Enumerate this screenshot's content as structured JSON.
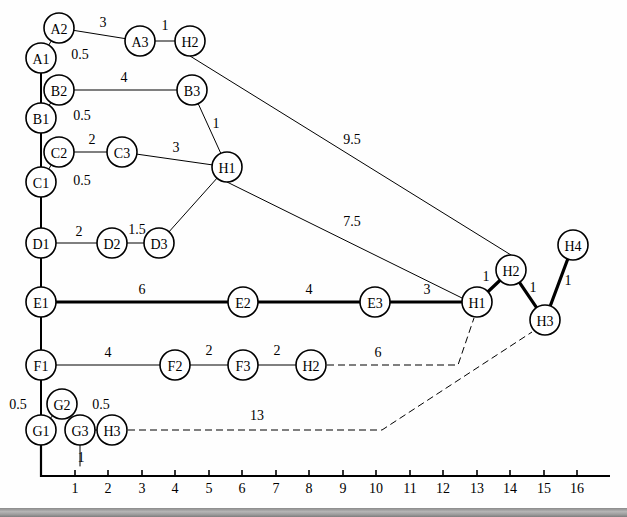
{
  "figure": {
    "node_radius": 15,
    "colors": {
      "stroke": "#000000",
      "fill": "#ffffff",
      "background": "#fefefe",
      "bar": "#9a9a9a"
    }
  },
  "axis": {
    "orientation": "horizontal",
    "origin": {
      "x": 41,
      "y": 476
    },
    "ticks": [
      "1",
      "2",
      "3",
      "4",
      "5",
      "6",
      "7",
      "8",
      "9",
      "10",
      "11",
      "12",
      "13",
      "14",
      "15",
      "16"
    ],
    "tick_positions": [
      75,
      108,
      142,
      175,
      209,
      242,
      276,
      309,
      343,
      376,
      410,
      443,
      477,
      510,
      544,
      577
    ],
    "vertical_segment_top": 430
  },
  "nodes": [
    {
      "id": "A2",
      "label": "A2",
      "x": 59,
      "y": 28
    },
    {
      "id": "A3",
      "label": "A3",
      "x": 140,
      "y": 41
    },
    {
      "id": "H2t",
      "label": "H2",
      "x": 190,
      "y": 41
    },
    {
      "id": "A1",
      "label": "A1",
      "x": 41,
      "y": 58
    },
    {
      "id": "B2",
      "label": "B2",
      "x": 59,
      "y": 90
    },
    {
      "id": "B3",
      "label": "B3",
      "x": 192,
      "y": 90
    },
    {
      "id": "B1",
      "label": "B1",
      "x": 41,
      "y": 118
    },
    {
      "id": "C2",
      "label": "C2",
      "x": 59,
      "y": 152
    },
    {
      "id": "C3",
      "label": "C3",
      "x": 122,
      "y": 152
    },
    {
      "id": "H1c",
      "label": "H1",
      "x": 227,
      "y": 167
    },
    {
      "id": "C1",
      "label": "C1",
      "x": 41,
      "y": 182
    },
    {
      "id": "D1",
      "label": "D1",
      "x": 41,
      "y": 243
    },
    {
      "id": "D2",
      "label": "D2",
      "x": 112,
      "y": 243
    },
    {
      "id": "D3",
      "label": "D3",
      "x": 159,
      "y": 243
    },
    {
      "id": "H4",
      "label": "H4",
      "x": 573,
      "y": 245
    },
    {
      "id": "H2r",
      "label": "H2",
      "x": 511,
      "y": 270
    },
    {
      "id": "E1",
      "label": "E1",
      "x": 41,
      "y": 302
    },
    {
      "id": "E2",
      "label": "E2",
      "x": 243,
      "y": 302
    },
    {
      "id": "E3",
      "label": "E3",
      "x": 375,
      "y": 302
    },
    {
      "id": "H1r",
      "label": "H1",
      "x": 477,
      "y": 302
    },
    {
      "id": "H3r",
      "label": "H3",
      "x": 545,
      "y": 320
    },
    {
      "id": "F1",
      "label": "F1",
      "x": 41,
      "y": 365
    },
    {
      "id": "F2",
      "label": "F2",
      "x": 175,
      "y": 365
    },
    {
      "id": "F3",
      "label": "F3",
      "x": 243,
      "y": 365
    },
    {
      "id": "H2f",
      "label": "H2",
      "x": 311,
      "y": 365
    },
    {
      "id": "G2",
      "label": "G2",
      "x": 62,
      "y": 404
    },
    {
      "id": "G1",
      "label": "G1",
      "x": 41,
      "y": 430
    },
    {
      "id": "G3",
      "label": "G3",
      "x": 80,
      "y": 430
    },
    {
      "id": "H3g",
      "label": "H3",
      "x": 112,
      "y": 430
    }
  ],
  "edges": [
    {
      "from": "A2",
      "to": "A3",
      "weight": "3",
      "style": "thin",
      "label_x": 103,
      "label_y": 27
    },
    {
      "from": "A3",
      "to": "H2t",
      "weight": "1",
      "style": "thin",
      "label_x": 165,
      "label_y": 30
    },
    {
      "from": "A2",
      "to": "A1",
      "weight": "0.5",
      "style": "thin",
      "label_x": 80,
      "label_y": 59
    },
    {
      "from": "A1",
      "to": "B1",
      "weight": "",
      "style": "medium",
      "label_x": 0,
      "label_y": 0
    },
    {
      "from": "B2",
      "to": "B3",
      "weight": "4",
      "style": "thin",
      "label_x": 124,
      "label_y": 82
    },
    {
      "from": "B2",
      "to": "B1",
      "weight": "0.5",
      "style": "thin",
      "label_x": 82,
      "label_y": 120
    },
    {
      "from": "B3",
      "to": "H1c",
      "weight": "1",
      "style": "thin",
      "label_x": 216,
      "label_y": 128
    },
    {
      "from": "B1",
      "to": "C1",
      "weight": "",
      "style": "medium",
      "label_x": 0,
      "label_y": 0
    },
    {
      "from": "C2",
      "to": "C3",
      "weight": "2",
      "style": "thin",
      "label_x": 92,
      "label_y": 144
    },
    {
      "from": "C3",
      "to": "H1c",
      "weight": "3",
      "style": "thin",
      "label_x": 176,
      "label_y": 152
    },
    {
      "from": "C2",
      "to": "C1",
      "weight": "0.5",
      "style": "thin",
      "label_x": 82,
      "label_y": 185
    },
    {
      "from": "C1",
      "to": "D1",
      "weight": "",
      "style": "medium",
      "label_x": 0,
      "label_y": 0
    },
    {
      "from": "D1",
      "to": "D2",
      "weight": "2",
      "style": "thin",
      "label_x": 79,
      "label_y": 236
    },
    {
      "from": "D2",
      "to": "D3",
      "weight": "1.5",
      "style": "thin",
      "label_x": 137,
      "label_y": 234
    },
    {
      "from": "D3",
      "to": "H1c",
      "weight": "",
      "style": "thin",
      "label_x": 0,
      "label_y": 0
    },
    {
      "from": "D1",
      "to": "E1",
      "weight": "",
      "style": "medium",
      "label_x": 0,
      "label_y": 0
    },
    {
      "from": "E1",
      "to": "E2",
      "weight": "6",
      "style": "bold",
      "label_x": 142,
      "label_y": 294
    },
    {
      "from": "E2",
      "to": "E3",
      "weight": "4",
      "style": "bold",
      "label_x": 309,
      "label_y": 294
    },
    {
      "from": "E3",
      "to": "H1r",
      "weight": "3",
      "style": "bold",
      "label_x": 427,
      "label_y": 294
    },
    {
      "from": "H1r",
      "to": "H2r",
      "weight": "1",
      "style": "bold",
      "label_x": 486,
      "label_y": 281
    },
    {
      "from": "H2r",
      "to": "H3r",
      "weight": "1",
      "style": "bold",
      "label_x": 533,
      "label_y": 292
    },
    {
      "from": "H3r",
      "to": "H4",
      "weight": "1",
      "style": "bold",
      "label_x": 568,
      "label_y": 285
    },
    {
      "from": "E1",
      "to": "F1",
      "weight": "",
      "style": "medium",
      "label_x": 0,
      "label_y": 0
    },
    {
      "from": "F1",
      "to": "F2",
      "weight": "4",
      "style": "thin",
      "label_x": 108,
      "label_y": 357
    },
    {
      "from": "F2",
      "to": "F3",
      "weight": "2",
      "style": "thin",
      "label_x": 209,
      "label_y": 355
    },
    {
      "from": "F3",
      "to": "H2f",
      "weight": "2",
      "style": "thin",
      "label_x": 277,
      "label_y": 355
    },
    {
      "from": "F1",
      "to": "G1",
      "weight": "",
      "style": "medium",
      "label_x": 0,
      "label_y": 0
    },
    {
      "from": "G2",
      "to": "G1",
      "weight": "0.5",
      "style": "thin",
      "label_x": 18,
      "label_y": 409
    },
    {
      "from": "G2",
      "to": "G3",
      "weight": "0.5",
      "style": "thin",
      "label_x": 101,
      "label_y": 409
    },
    {
      "from": "G3",
      "to": "H3g",
      "weight": "",
      "style": "thin",
      "label_x": 0,
      "label_y": 0
    },
    {
      "from": "G3",
      "to": "stub",
      "weight": "1",
      "style": "thin",
      "label_x": 81,
      "label_y": 462
    }
  ],
  "long_links": [
    {
      "id": "link-9-5",
      "weight": "9.5",
      "style": "thin",
      "label_x": 352,
      "label_y": 144,
      "points": "190,56 511,255"
    },
    {
      "id": "link-7-5",
      "weight": "7.5",
      "style": "thin",
      "label_x": 352,
      "label_y": 226,
      "points": "227,182 462,298"
    },
    {
      "id": "link-6",
      "weight": "6",
      "style": "dashed",
      "label_x": 378,
      "label_y": 357,
      "points": "327,365 458,365 474,318"
    },
    {
      "id": "link-13",
      "weight": "13",
      "style": "dashed",
      "label_x": 257,
      "label_y": 420,
      "points": "128,430 382,430 532,332"
    }
  ]
}
